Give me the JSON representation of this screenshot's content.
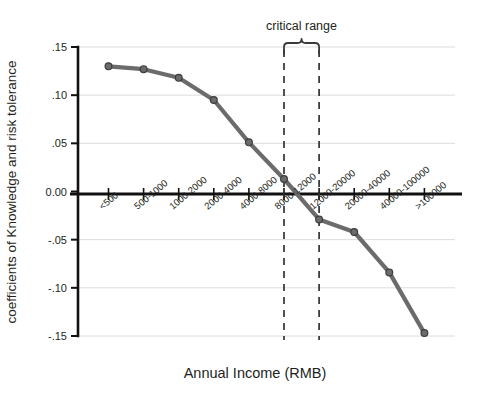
{
  "chart_data": {
    "type": "line",
    "title": "",
    "xlabel": "Annual Income (RMB)",
    "ylabel": "coefficients of Knowledge and risk tolerance",
    "categories": [
      "<500",
      "500-1000",
      "1000-2000",
      "2000-4000",
      "4000-8000",
      "8000-12000",
      "12000-20000",
      "20000-40000",
      "40000-100000",
      ">100000"
    ],
    "values": [
      0.13,
      0.127,
      0.118,
      0.095,
      0.051,
      0.013,
      -0.029,
      -0.042,
      -0.084,
      -0.147
    ],
    "ylim": [
      -0.15,
      0.15
    ],
    "yticks": [
      0.15,
      0.1,
      0.05,
      0.0,
      -0.05,
      -0.1,
      -0.15
    ],
    "ytick_labels": [
      ".15",
      ".10",
      ".05",
      "0.00",
      "-.05",
      "-.10",
      "-.15"
    ],
    "grid": true,
    "legend": "none",
    "series_color": "#6b6b6b",
    "marker_color": "#5a5a5a",
    "zero_line": 0.0,
    "annotations": [
      {
        "label": "critical range",
        "type": "brace-with-dashed-bounds",
        "from_category": "8000-12000",
        "to_category": "12000-20000"
      }
    ]
  },
  "axis": {
    "y_title": "coefficients of Knowledge and risk tolerance",
    "x_title": "Annual Income (RMB)"
  },
  "annotation": {
    "critical_range_label": "critical range"
  },
  "colors": {
    "line": "#6b6b6b",
    "marker_fill": "#6b6b6b",
    "marker_stroke": "#3d3d3d",
    "axis": "#111111",
    "grid": "#dcdcdc",
    "text": "#231f20"
  }
}
